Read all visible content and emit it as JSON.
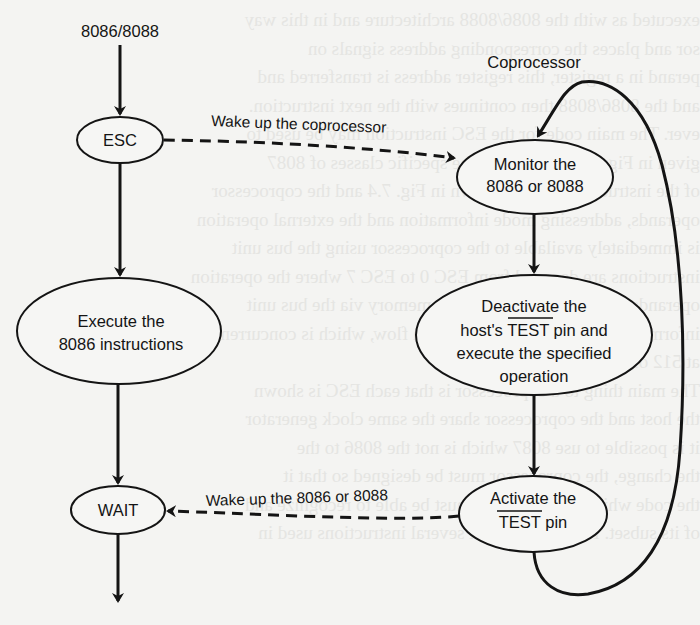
{
  "diagram": {
    "host_label": "8086/8088",
    "coprocessor_label": "Coprocessor",
    "host_nodes": [
      {
        "id": "esc",
        "lines": [
          "ESC"
        ]
      },
      {
        "id": "execute",
        "lines": [
          "Execute the",
          "8086 instructions"
        ]
      },
      {
        "id": "wait",
        "lines": [
          "WAIT"
        ]
      }
    ],
    "coprocessor_nodes": [
      {
        "id": "monitor",
        "lines": [
          "Monitor the",
          "8086 or 8088"
        ]
      },
      {
        "id": "deactivate",
        "lines": [
          "Deactivate the",
          "host's",
          "TEST",
          "pin and",
          "execute the specified",
          "operation"
        ],
        "overlined": "TEST"
      },
      {
        "id": "activate",
        "lines": [
          "Activate the",
          "TEST",
          "pin"
        ],
        "overlined": "TEST"
      }
    ],
    "edges": [
      {
        "from": "esc",
        "to": "monitor",
        "style": "dashed",
        "label": "Wake up the coprocessor"
      },
      {
        "from": "activate",
        "to": "wait",
        "style": "dashed",
        "label": "Wake up the 8086 or 8088"
      },
      {
        "from": "host_label",
        "to": "esc",
        "style": "solid"
      },
      {
        "from": "esc",
        "to": "execute",
        "style": "solid"
      },
      {
        "from": "execute",
        "to": "wait",
        "style": "solid"
      },
      {
        "from": "wait",
        "to": "exit",
        "style": "solid"
      },
      {
        "from": "monitor",
        "to": "deactivate",
        "style": "solid"
      },
      {
        "from": "deactivate",
        "to": "activate",
        "style": "solid"
      },
      {
        "from": "activate",
        "to": "monitor",
        "style": "solid",
        "shape": "loop"
      }
    ]
  },
  "background_bleed": [
    "executed as with the 8086/8088 architecture and in this way",
    "sor and places the corresponding address signals on",
    "perand in a register, this register address is transferred and",
    "and the 8086/8088 then continues with the next instruction.",
    "ever. The main code for the ESC instruction may be used to",
    "given in Figure 7.2. It covers the specific classes of 8087",
    "of the instruction codes is shown in Fig. 7.4 and the coprocessor",
    "operands, addressing mode information and the external operation",
    "is immediately available to the coprocessor using the bus unit",
    "instructions are decoded from ESC 0 to ESC 7 where the operation",
    "operands and the result is stored in memory via the bus unit",
    "information, as well as the instruction flow, which is concurrently",
    "at 512 of the host processor.",
    "The main thing to a coprocessor is that each ESC is shown",
    "the host and the coprocessor share the same clock generator",
    "it is possible to use 8087 which is not the 8086 to the",
    "the change, the coprocessor must be designed so that it",
    "the code which a coprocessor must be able to recognize and",
    "of its subset. For the most part several instructions used in"
  ]
}
